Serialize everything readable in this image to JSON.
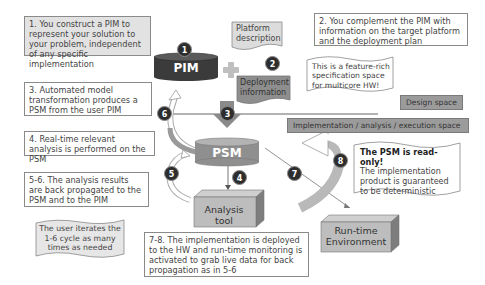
{
  "notes": {
    "n1": "1. You construct a PIM to represent your solution to your problem, independent of any specific implementation",
    "n2": "2. You complement the PIM with information on the target platform and the deployment plan",
    "n3": "3. Automated model transformation produces a PSM from the user PIM",
    "n4": "4. Real-time relevant analysis is performed on the PSM",
    "n56": "5-6. The analysis results are back propagated to the PSM and to the PIM",
    "n78": "7-8. The implementation is deployed to the HW and run-time monitoring is activated to grab live data for back propagation as in 5-6"
  },
  "callouts": {
    "feature_rich": "This is a feature-rich specification space for multicore HW!",
    "iterate": "The user iterates the 1-6 cycle as many times as needed",
    "readonly_title": "The PSM is read-only!",
    "readonly_body": "The implementation product is guaranteed to be deterministic"
  },
  "shapes": {
    "pim": "PIM",
    "psm": "PSM",
    "platform_description": "Platform description",
    "deployment_information": "Deployment information",
    "analysis_tool": "Analysis tool",
    "runtime_env": "Run-time Environment"
  },
  "spaces": {
    "design": "Design space",
    "implementation": "Implementation / analysis / execution space"
  },
  "steps": [
    "1",
    "2",
    "3",
    "4",
    "5",
    "6",
    "7",
    "8"
  ],
  "colors": {
    "pim_fill": "#3b3b3b",
    "psm_fill": "#8f8f8f",
    "step_badge": "#2d2d2d",
    "space_label": "#9b9b9b"
  }
}
